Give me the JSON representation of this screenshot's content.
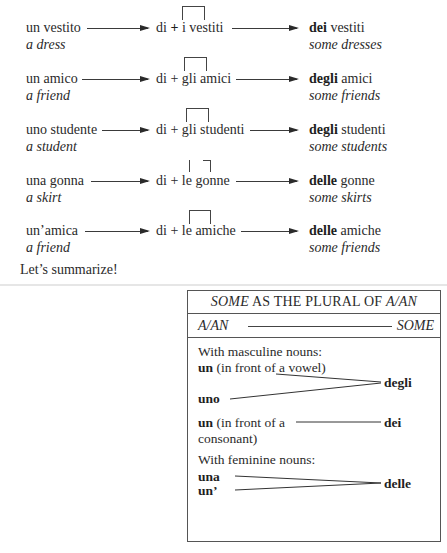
{
  "examples": [
    {
      "singular": "un vestito",
      "singular_en": "a dress",
      "di": "di",
      "plus": "+",
      "article": "i",
      "plural_noun": "vestiti",
      "partitive": "dei",
      "result_noun": "vestiti",
      "plural_en": "some dresses"
    },
    {
      "singular": "un amico",
      "singular_en": "a friend",
      "di": "di",
      "plus": "+",
      "article": "gli",
      "plural_noun": "amici",
      "partitive": "degli",
      "result_noun": "amici",
      "plural_en": "some friends"
    },
    {
      "singular": "uno studente",
      "singular_en": "a student",
      "di": "di",
      "plus": "+",
      "article": "gli",
      "plural_noun": "studenti",
      "partitive": "degli",
      "result_noun": "studenti",
      "plural_en": "some students"
    },
    {
      "singular": "una gonna",
      "singular_en": "a skirt",
      "di": "di",
      "plus": "+",
      "article": "le",
      "plural_noun": "gonne",
      "partitive": "delle",
      "result_noun": "gonne",
      "plural_en": "some skirts"
    },
    {
      "singular": "un’amica",
      "singular_en": "a friend",
      "di": "di",
      "plus": "+",
      "article": "le",
      "plural_noun": "amiche",
      "partitive": "delle",
      "result_noun": "amiche",
      "plural_en": "some friends"
    }
  ],
  "summary_intro": "Let’s summarize!",
  "summary_box": {
    "title_italic": "SOME",
    "title_middle": " AS THE PLURAL OF ",
    "title_italic2": "A/AN",
    "col_left": "A/AN",
    "col_right": "SOME",
    "masculine_heading": "With masculine nouns:",
    "un_vowel_bold": "un",
    "un_vowel_note": " (in front of a vowel)",
    "uno": "uno",
    "degli": "degli",
    "un_consonant_bold": "un",
    "un_consonant_note": " (in front of a",
    "un_consonant_note2": "consonant)",
    "dei": "dei",
    "feminine_heading": "With feminine nouns:",
    "una": "una",
    "un_apostrophe": "un’",
    "delle": "delle"
  }
}
